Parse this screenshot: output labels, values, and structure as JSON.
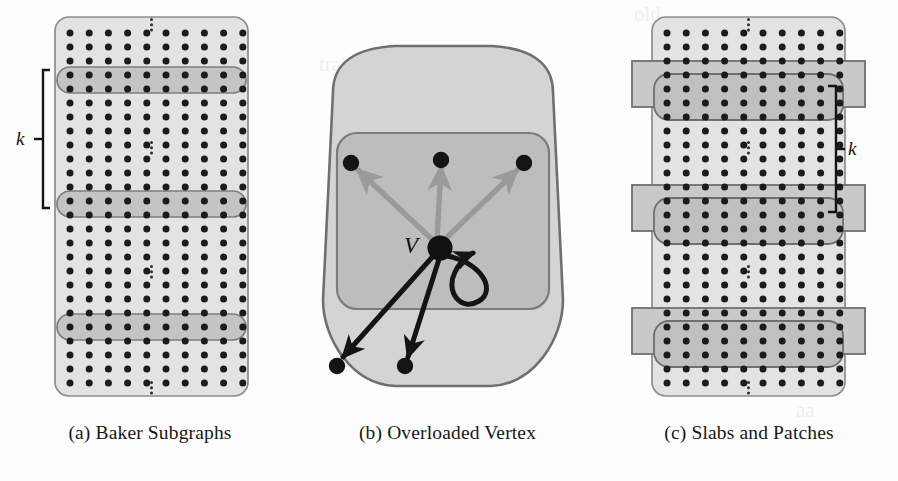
{
  "figure": {
    "width": 898,
    "height": 481,
    "background": "#fdfdfd"
  },
  "palette": {
    "grid_fill": "#e3e3e3",
    "grid_stroke": "#8d8d8d",
    "band_fill": "#c4c4c4",
    "band_stroke": "#7e7e7e",
    "slab_fill": "#c9c9c9",
    "slab_stroke": "#6f6f6f",
    "dot_color": "#1b1b1b",
    "outer_blob_fill": "#d4d4d4",
    "outer_blob_stroke": "#6f6f6f",
    "inner_box_fill": "#bdbdbd",
    "inner_box_stroke": "#7b7b7b",
    "arrow_light": "#9a9a9a",
    "arrow_dark": "#141414",
    "text_color": "#171717"
  },
  "panels": [
    {
      "id": "a",
      "caption": "(a) Baker Subgraphs",
      "bracket_label": "k",
      "bracket_side": "left",
      "grid": {
        "columns": 10,
        "rows": 26
      },
      "band_count": 3,
      "band_rows": 2,
      "ellipsis_count": 4
    },
    {
      "id": "b",
      "caption": "(b) Overloaded Vertex",
      "center_vertex_label": "V",
      "upper_neighbors": 3,
      "lower_neighbors": 2,
      "self_loop": true,
      "upper_edge_color": "#9a9a9a",
      "lower_edge_color": "#141414"
    },
    {
      "id": "c",
      "caption": "(c) Slabs and Patches",
      "bracket_label": "k",
      "bracket_side": "right",
      "grid": {
        "columns": 10,
        "rows": 26
      },
      "slab_count": 3,
      "slab_rows": 4,
      "patch_rows": 2,
      "ellipsis_count": 4
    }
  ],
  "bleed_artifacts": [
    {
      "panel": "b",
      "text": "trailing of a dim",
      "x": 24,
      "y": 52
    },
    {
      "panel": "b",
      "text": "an effort of",
      "x": 40,
      "y": 86
    },
    {
      "panel": "b",
      "text": "the mirror",
      "x": 56,
      "y": 112
    },
    {
      "panel": "c",
      "text": "old",
      "x": 34,
      "y": 10
    },
    {
      "panel": "c",
      "text": "aa",
      "x": 196,
      "y": 400
    }
  ]
}
